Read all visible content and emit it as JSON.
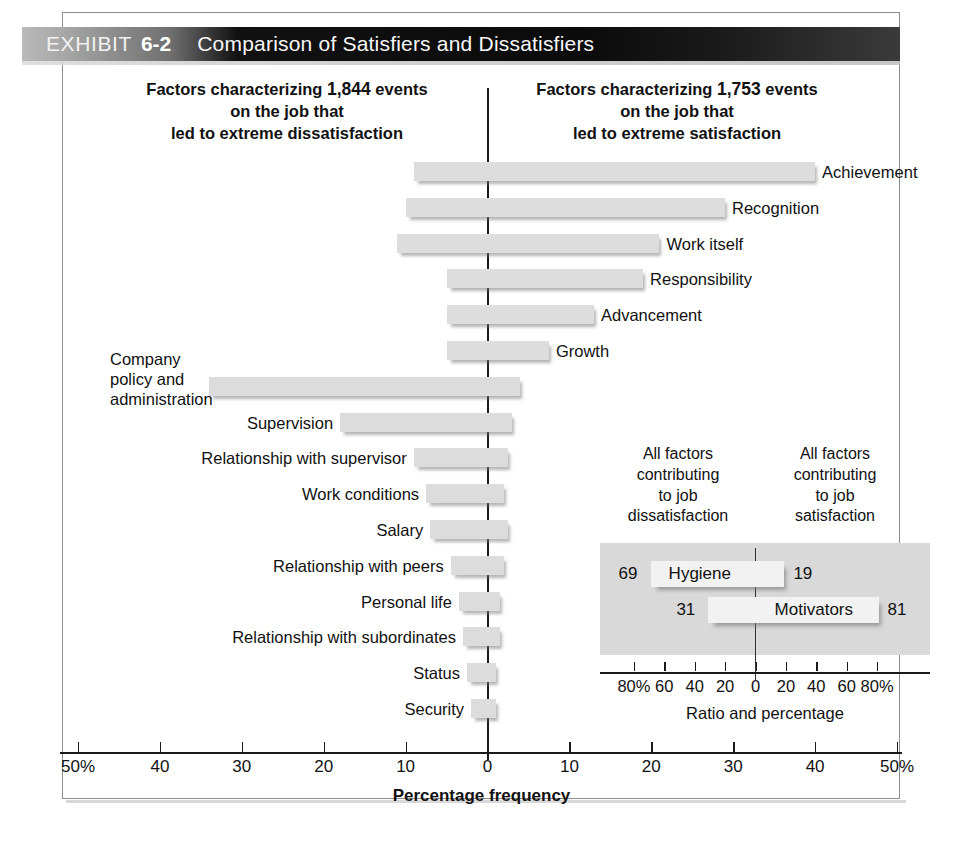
{
  "header": {
    "exhibit_word": "EXHIBIT",
    "exhibit_number": "6-2",
    "title": "Comparison of Satisfiers and Dissatisfiers"
  },
  "columns": {
    "left": {
      "line1_a": "Factors characterizing ",
      "line1_b": "1,844",
      "line1_c": " events",
      "line2": "on the job that",
      "line3": "led to extreme dissatisfaction"
    },
    "right": {
      "line1_a": "Factors characterizing ",
      "line1_b": "1,753",
      "line1_c": " events",
      "line2": "on the job that",
      "line3": "led to extreme satisfaction"
    }
  },
  "chart_data": {
    "type": "bar",
    "orientation": "horizontal-diverging",
    "title": "Comparison of Satisfiers and Dissatisfiers",
    "xlabel": "Percentage frequency",
    "ylabel": "",
    "xlim": [
      -50,
      50
    ],
    "xticks": [
      -50,
      -40,
      -30,
      -20,
      -10,
      0,
      10,
      20,
      30,
      40,
      50
    ],
    "xtick_labels": [
      "50%",
      "40",
      "30",
      "20",
      "10",
      "0",
      "10",
      "20",
      "30",
      "40",
      "50%"
    ],
    "grid": false,
    "legend": "none",
    "note": "Each factor is one bar spanning from its dissatisfaction percentage (left of 0) to its satisfaction percentage (right of 0).",
    "categories": [
      "Achievement",
      "Recognition",
      "Work itself",
      "Responsibility",
      "Advancement",
      "Growth",
      "Company policy and administration",
      "Supervision",
      "Relationship with supervisor",
      "Work conditions",
      "Salary",
      "Relationship with peers",
      "Personal life",
      "Relationship with subordinates",
      "Status",
      "Security"
    ],
    "series": [
      {
        "name": "Dissatisfaction (left of zero, %)",
        "values": [
          9,
          10,
          11,
          5,
          5,
          5,
          34,
          18,
          9,
          7.5,
          7,
          4.5,
          3.5,
          3,
          2.5,
          2
        ]
      },
      {
        "name": "Satisfaction (right of zero, %)",
        "values": [
          40,
          29,
          21,
          19,
          13,
          7.5,
          4,
          3,
          2.5,
          2,
          2.5,
          2,
          1.5,
          1.5,
          1,
          1
        ]
      }
    ],
    "bars": [
      {
        "label": "Achievement",
        "group": "motivator",
        "left_pct": 9,
        "right_pct": 40,
        "label_side": "right"
      },
      {
        "label": "Recognition",
        "group": "motivator",
        "left_pct": 10,
        "right_pct": 29,
        "label_side": "right"
      },
      {
        "label": "Work itself",
        "group": "motivator",
        "left_pct": 11,
        "right_pct": 21,
        "label_side": "right"
      },
      {
        "label": "Responsibility",
        "group": "motivator",
        "left_pct": 5,
        "right_pct": 19,
        "label_side": "right"
      },
      {
        "label": "Advancement",
        "group": "motivator",
        "left_pct": 5,
        "right_pct": 13,
        "label_side": "right"
      },
      {
        "label": "Growth",
        "group": "motivator",
        "left_pct": 5,
        "right_pct": 7.5,
        "label_side": "right"
      },
      {
        "label": "Company policy and administration",
        "group": "hygiene",
        "left_pct": 34,
        "right_pct": 4,
        "label_side": "left"
      },
      {
        "label": "Supervision",
        "group": "hygiene",
        "left_pct": 18,
        "right_pct": 3,
        "label_side": "left"
      },
      {
        "label": "Relationship with supervisor",
        "group": "hygiene",
        "left_pct": 9,
        "right_pct": 2.5,
        "label_side": "left"
      },
      {
        "label": "Work conditions",
        "group": "hygiene",
        "left_pct": 7.5,
        "right_pct": 2,
        "label_side": "left"
      },
      {
        "label": "Salary",
        "group": "hygiene",
        "left_pct": 7,
        "right_pct": 2.5,
        "label_side": "left"
      },
      {
        "label": "Relationship with peers",
        "group": "hygiene",
        "left_pct": 4.5,
        "right_pct": 2,
        "label_side": "left"
      },
      {
        "label": "Personal life",
        "group": "hygiene",
        "left_pct": 3.5,
        "right_pct": 1.5,
        "label_side": "left"
      },
      {
        "label": "Relationship with subordinates",
        "group": "hygiene",
        "left_pct": 3,
        "right_pct": 1.5,
        "label_side": "left"
      },
      {
        "label": "Status",
        "group": "hygiene",
        "left_pct": 2.5,
        "right_pct": 1,
        "label_side": "left"
      },
      {
        "label": "Security",
        "group": "hygiene",
        "left_pct": 2,
        "right_pct": 1,
        "label_side": "left"
      }
    ]
  },
  "inset": {
    "caption_left": [
      "All factors",
      "contributing",
      "to job",
      "dissatisfaction"
    ],
    "caption_right": [
      "All factors",
      "contributing",
      "to job",
      "satisfaction"
    ],
    "axis_title": "Ratio and percentage",
    "xticks": [
      -80,
      -60,
      -40,
      -20,
      0,
      20,
      40,
      60,
      80
    ],
    "xtick_labels": [
      "80%",
      "60",
      "40",
      "20",
      "0",
      "20",
      "40",
      "60",
      "80%"
    ],
    "rows": [
      {
        "label": "Hygiene",
        "left_value": "69",
        "right_value": "19",
        "left_pct": 69,
        "right_pct": 19
      },
      {
        "label": "Motivators",
        "left_value": "31",
        "right_value": "81",
        "left_pct": 31,
        "right_pct": 81
      }
    ]
  },
  "colors": {
    "bar_fill": "#dcdcdc",
    "inset_panel": "#d9d9d9",
    "inset_bar_fill": "#f2f2f2",
    "axis": "#1a1a1a",
    "frame": "#8d8d8d",
    "header_band_dark": "#0b0b0b",
    "header_text": "#f7f7f7"
  }
}
